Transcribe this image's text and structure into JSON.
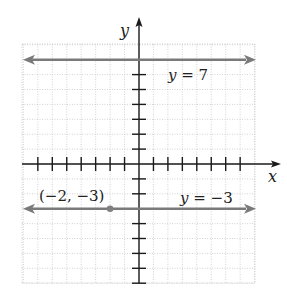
{
  "chart_data": {
    "type": "line",
    "title": "",
    "xlabel": "x",
    "ylabel": "y",
    "xlim": [
      -8,
      8
    ],
    "ylim": [
      -8,
      8
    ],
    "grid": true,
    "x_ticks": [
      -7,
      -6,
      -5,
      -4,
      -3,
      -2,
      -1,
      1,
      2,
      3,
      4,
      5,
      6,
      7
    ],
    "y_ticks": [
      -8,
      -7,
      -6,
      -5,
      -4,
      -3,
      -2,
      -1,
      1,
      2,
      3,
      4,
      5,
      6,
      7
    ],
    "series": [
      {
        "name": "y = 7",
        "kind": "horizontal-line",
        "y": 7,
        "color": "#7a7a7a"
      },
      {
        "name": "y = −3",
        "kind": "horizontal-line",
        "y": -3,
        "color": "#7a7a7a"
      }
    ],
    "points": [
      {
        "label": "(−2, −3)",
        "x": -2,
        "y": -3,
        "color": "#808080"
      }
    ],
    "annotations": [
      {
        "text": "y = 7",
        "x": 3,
        "y": 6.2
      },
      {
        "text": "y = −3",
        "x": 3,
        "y": -2.3
      },
      {
        "text": "(−2, −3)",
        "x": -5.5,
        "y": -2.3
      }
    ]
  },
  "labels": {
    "x_axis": "x",
    "y_axis": "y",
    "line_top": "y = 7",
    "line_bottom": "y = −3",
    "point": "(−2, −3)"
  },
  "colors": {
    "axis": "#1a1a1a",
    "line": "#7a7a7a",
    "grid": "#c8c8c8",
    "point": "#808080"
  }
}
